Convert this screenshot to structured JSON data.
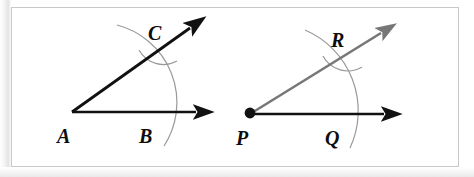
{
  "figure": {
    "background_color": "#ffffff",
    "frame_border_color": "#c9c9c9",
    "ray_color_left": "#111111",
    "ray_color_right": "#777777",
    "horizontal_ray_color_right": "#111111",
    "arc_color": "#9a9a9a",
    "label_color": "#0d0d0d"
  },
  "angles": [
    {
      "name": "angle-A",
      "vertex": {
        "label": "A",
        "x": 72,
        "y": 112
      },
      "arc_point_on_base": {
        "label": "B",
        "x": 150,
        "y": 112
      },
      "arc_point_on_slant": {
        "label": "C",
        "x": 157,
        "y": 40
      },
      "vertex_dot": false,
      "slant_ray_color": "#111111"
    },
    {
      "name": "angle-P",
      "vertex": {
        "label": "P",
        "x": 250,
        "y": 114
      },
      "arc_point_on_base": {
        "label": "Q",
        "x": 336,
        "y": 114
      },
      "arc_point_on_slant": {
        "label": "R",
        "x": 340,
        "y": 47
      },
      "vertex_dot": true,
      "slant_ray_color": "#777777"
    }
  ],
  "labels": {
    "A": "A",
    "B": "B",
    "C": "C",
    "P": "P",
    "Q": "Q",
    "R": "R"
  }
}
